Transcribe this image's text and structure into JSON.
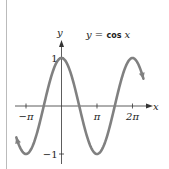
{
  "chart_data": {
    "type": "line",
    "title": "",
    "xlabel": "x",
    "ylabel": "y",
    "equation": {
      "lhs": "y = ",
      "func": "cos",
      "var": " x"
    },
    "function": "cos",
    "x_domain": [
      -4.0,
      7.25
    ],
    "x_ticks": [
      {
        "value": -3.14159,
        "label": "−π"
      },
      {
        "value": 3.14159,
        "label": "π"
      },
      {
        "value": 6.28318,
        "label": "2π"
      }
    ],
    "y_ticks": [
      {
        "value": 1,
        "label": "1"
      },
      {
        "value": -1,
        "label": "−1"
      }
    ],
    "ylim": [
      -1,
      1
    ],
    "grid": false,
    "series": [
      {
        "name": "y = cos x",
        "color": "#808080"
      }
    ],
    "colors": {
      "curve": "#808080",
      "axes": "#333333",
      "frame": "#bbbbbb"
    }
  }
}
